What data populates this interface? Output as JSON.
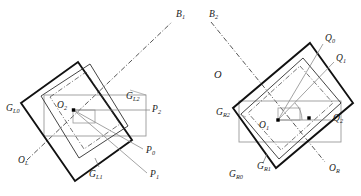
{
  "figure": {
    "background_color": "#ffffff",
    "width": 361,
    "height": 196
  },
  "colors": {
    "thick_box": "#111111",
    "thin_box": "#3a3a3a",
    "gray_box": "#9a9a9a",
    "dashdot": "#2b2b2b",
    "leader": "#8c8c8c",
    "point": "#000000",
    "text": "#1a1a1a"
  },
  "left_group": {
    "name": "left-configuration",
    "labels": [
      {
        "id": "G_L0",
        "base": "G",
        "sub": "L0",
        "x": 6,
        "y": 104
      },
      {
        "id": "G_L2",
        "base": "G",
        "sub": "L2",
        "x": 126,
        "y": 92
      },
      {
        "id": "O_2",
        "base": "O",
        "sub": "2",
        "x": 76,
        "y": 101
      },
      {
        "id": "O_L",
        "base": "O",
        "sub": "L",
        "x": 18,
        "y": 156
      },
      {
        "id": "G_L1",
        "base": "G",
        "sub": "L1",
        "x": 89,
        "y": 170
      },
      {
        "id": "P_2",
        "base": "P",
        "sub": "2",
        "x": 152,
        "y": 117
      },
      {
        "id": "P_0",
        "base": "P",
        "sub": "0",
        "x": 146,
        "y": 152
      },
      {
        "id": "P_1",
        "base": "P",
        "sub": "1",
        "x": 150,
        "y": 177
      },
      {
        "id": "B_1",
        "base": "B",
        "sub": "1",
        "x": 176,
        "y": 14
      }
    ]
  },
  "right_group": {
    "name": "right-configuration",
    "labels": [
      {
        "id": "B_2",
        "base": "B",
        "sub": "2",
        "x": 209,
        "y": 14
      },
      {
        "id": "G_R2",
        "base": "G",
        "sub": "R2",
        "x": 222,
        "y": 113
      },
      {
        "id": "O_1",
        "base": "O",
        "sub": "1",
        "x": 265,
        "y": 127
      },
      {
        "id": "Q_0",
        "base": "Q",
        "sub": "0",
        "x": 325,
        "y": 38
      },
      {
        "id": "Q_1",
        "base": "Q",
        "sub": "1",
        "x": 336,
        "y": 58
      },
      {
        "id": "Q_2",
        "base": "Q",
        "sub": "2",
        "x": 333,
        "y": 124
      },
      {
        "id": "G_R1",
        "base": "G",
        "sub": "R1",
        "x": 257,
        "y": 166
      },
      {
        "id": "G_R0",
        "base": "G",
        "sub": "R0",
        "x": 229,
        "y": 174
      },
      {
        "id": "O_R",
        "base": "O",
        "sub": "R",
        "x": 329,
        "y": 168
      }
    ]
  },
  "center_label": {
    "id": "O",
    "base": "O",
    "sub": "",
    "x": 214,
    "y": 72
  },
  "markers": [
    {
      "name": "origin-point-left",
      "x": 73.5,
      "y": 110
    },
    {
      "name": "origin-point-right",
      "x": 278,
      "y": 120
    },
    {
      "name": "corner-point-right",
      "x": 309,
      "y": 118
    }
  ]
}
